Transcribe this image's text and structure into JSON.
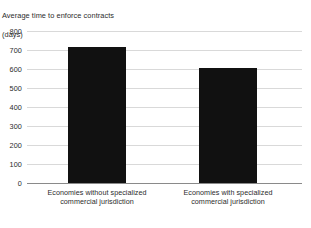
{
  "chart_data": {
    "type": "bar",
    "title": "Average time to enforce contracts\n(days)",
    "title_line1": "Average time to enforce contracts",
    "title_line2": "(days)",
    "xlabel": "",
    "ylabel": "days",
    "ylim": [
      0,
      800
    ],
    "ytick_step": 100,
    "yticks": [
      800,
      700,
      600,
      500,
      400,
      300,
      200,
      100,
      0
    ],
    "ytick_labels": [
      "800",
      "700",
      "600",
      "500",
      "400",
      "300",
      "200",
      "100",
      "0"
    ],
    "categories": [
      "Economies without specialized commercial jurisdiction",
      "Economies with specialized commercial jurisdiction"
    ],
    "category_lines": [
      [
        "Economies without specialized",
        "commercial jurisdiction"
      ],
      [
        "Economies with specialized",
        "commercial jurisdiction"
      ]
    ],
    "values": [
      715,
      605
    ],
    "grid": true,
    "legend": false,
    "bar_color": "#111111",
    "gridline_color": "#d9d9d9",
    "baseline_color": "#8a8a8a",
    "text_color": "#2b2b2b",
    "background_color": "#ffffff"
  }
}
